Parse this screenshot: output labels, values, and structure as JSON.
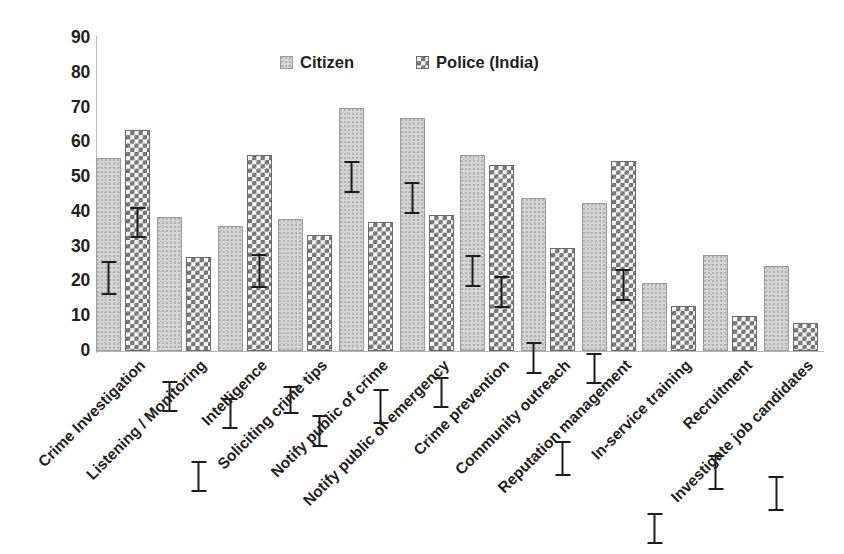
{
  "chart_data": {
    "type": "bar",
    "title": "",
    "subtitle": "",
    "xlabel": "",
    "ylabel": "",
    "ylim": [
      0,
      90
    ],
    "ytick_step": 10,
    "yticks": [
      90,
      80,
      70,
      60,
      50,
      40,
      30,
      20,
      10,
      0
    ],
    "grid": false,
    "legend_position": "top-center",
    "error_bars": true,
    "categories": [
      "Crime Investigation",
      "Listening / Monitoring",
      "Intelligence",
      "Soliciting crime tips",
      "Notify public of crime",
      "Notify public of emergency",
      "Crime prevention",
      "Community outreach",
      "Reputation management",
      "In-service training",
      "Recruitment",
      "Investigate job candidates"
    ],
    "series": [
      {
        "name": "Citizen",
        "swatch": "#d4d4d2",
        "pattern": "dotted-light-gray",
        "values": [
          55.5,
          38.5,
          36.0,
          38.0,
          70.0,
          67.0,
          56.5,
          44.0,
          42.5,
          19.5,
          27.5,
          24.5
        ],
        "errors": [
          5.0,
          4.5,
          4.5,
          4.0,
          4.5,
          4.5,
          4.5,
          4.5,
          4.5,
          4.5,
          5.0,
          5.0
        ]
      },
      {
        "name": "Police (India)",
        "swatch": "#6e6e6c",
        "pattern": "checkerboard",
        "values": [
          63.5,
          27.0,
          56.5,
          33.5,
          37.0,
          39.0,
          53.5,
          29.5,
          54.5,
          13.0,
          10.0,
          8.0
        ],
        "errors": [
          4.5,
          4.5,
          5.0,
          4.5,
          5.0,
          4.5,
          4.5,
          5.0,
          4.5,
          4.5,
          4.5,
          4.5
        ]
      }
    ]
  },
  "legend": {
    "items": [
      {
        "label": "Citizen"
      },
      {
        "label": "Police (India)"
      }
    ]
  }
}
